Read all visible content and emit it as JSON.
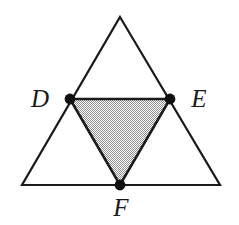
{
  "figure": {
    "background_color": "#ffffff",
    "stroke_color": "#1a1a1a",
    "shade_fill_color": "#c9c9c9",
    "shade_pattern": "checkerboard-stipple",
    "outer_triangle": {
      "name": "outer-triangle",
      "stroke_width": 2.2,
      "fill": "none",
      "vertices": [
        {
          "name": "apex",
          "x": 120,
          "y": 17
        },
        {
          "name": "bottom-right",
          "x": 220,
          "y": 185
        },
        {
          "name": "bottom-left",
          "x": 22,
          "y": 185
        }
      ]
    },
    "shaded_triangle": {
      "name": "shaded-medial-triangle",
      "stroke_width": 2.6,
      "vertices": [
        {
          "name": "D",
          "x": 70,
          "y": 99
        },
        {
          "name": "E",
          "x": 170,
          "y": 99
        },
        {
          "name": "F",
          "x": 120,
          "y": 185
        }
      ]
    },
    "points": [
      {
        "id": "D",
        "label": "D",
        "x": 70,
        "y": 99,
        "radius": 5.4,
        "label_x": 40,
        "label_y": 107,
        "label_anchor": "middle"
      },
      {
        "id": "E",
        "label": "E",
        "x": 170,
        "y": 99,
        "radius": 5.4,
        "label_x": 199,
        "label_y": 107,
        "label_anchor": "middle"
      },
      {
        "id": "F",
        "label": "F",
        "x": 120,
        "y": 185,
        "radius": 5.4,
        "label_x": 121,
        "label_y": 216,
        "label_anchor": "middle"
      }
    ]
  }
}
